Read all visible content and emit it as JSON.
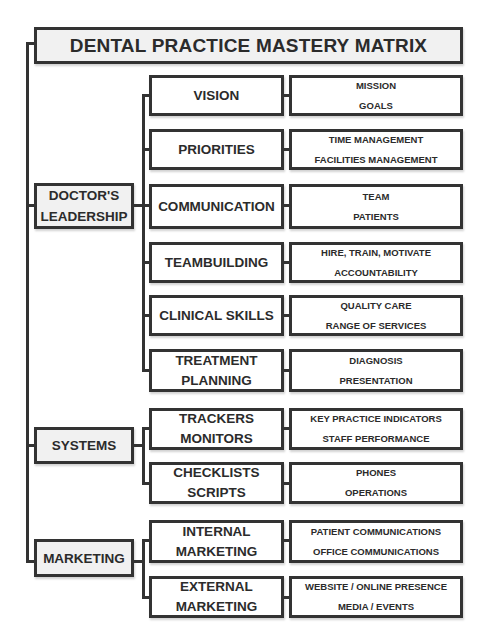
{
  "title": "DENTAL PRACTICE MASTERY MATRIX",
  "groups": [
    {
      "label_lines": [
        "DOCTOR'S",
        "LEADERSHIP"
      ],
      "items": [
        {
          "label_lines": [
            "VISION"
          ],
          "details": [
            "MISSION",
            "GOALS"
          ]
        },
        {
          "label_lines": [
            "PRIORITIES"
          ],
          "details": [
            "TIME MANAGEMENT",
            "FACILITIES MANAGEMENT"
          ]
        },
        {
          "label_lines": [
            "COMMUNICATION"
          ],
          "details": [
            "TEAM",
            "PATIENTS"
          ]
        },
        {
          "label_lines": [
            "TEAMBUILDING"
          ],
          "details": [
            "HIRE, TRAIN, MOTIVATE",
            "ACCOUNTABILITY"
          ]
        },
        {
          "label_lines": [
            "CLINICAL SKILLS"
          ],
          "details": [
            "QUALITY CARE",
            "RANGE OF SERVICES"
          ]
        },
        {
          "label_lines": [
            "TREATMENT",
            "PLANNING"
          ],
          "details": [
            "DIAGNOSIS",
            "PRESENTATION"
          ]
        }
      ]
    },
    {
      "label_lines": [
        "SYSTEMS"
      ],
      "items": [
        {
          "label_lines": [
            "TRACKERS",
            "MONITORS"
          ],
          "details": [
            "KEY PRACTICE INDICATORS",
            "STAFF PERFORMANCE"
          ]
        },
        {
          "label_lines": [
            "CHECKLISTS",
            "SCRIPTS"
          ],
          "details": [
            "PHONES",
            "OPERATIONS"
          ]
        }
      ]
    },
    {
      "label_lines": [
        "MARKETING"
      ],
      "items": [
        {
          "label_lines": [
            "INTERNAL",
            "MARKETING"
          ],
          "details": [
            "PATIENT COMMUNICATIONS",
            "OFFICE COMMUNICATIONS"
          ]
        },
        {
          "label_lines": [
            "EXTERNAL",
            "MARKETING"
          ],
          "details": [
            "WEBSITE / ONLINE PRESENCE",
            "MEDIA / EVENTS"
          ]
        }
      ]
    }
  ]
}
